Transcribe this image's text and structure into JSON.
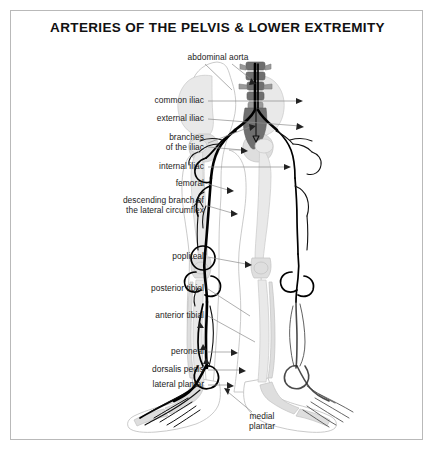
{
  "page": {
    "title": "ARTERIES OF THE PELVIS & LOWER EXTREMITY",
    "background_color": "#ffffff",
    "border_color": "#b9b9b9"
  },
  "figure": {
    "colors": {
      "artery": "#000000",
      "bone": "#e9e9e9",
      "bone_dark": "#6f6f6f",
      "body_outline": "#bdbdbd",
      "leader_line": "#8c8c8c"
    }
  },
  "labels": [
    {
      "id": "abdominal-aorta",
      "text": "abdominal aorta",
      "x": 218,
      "y": 58,
      "align": "center"
    },
    {
      "id": "common-iliac",
      "text": "common iliac",
      "x": 204,
      "y": 101,
      "align": "right"
    },
    {
      "id": "external-iliac",
      "text": "external iliac",
      "x": 204,
      "y": 119,
      "align": "right"
    },
    {
      "id": "branches-of-the-iliac",
      "text": "branches\nof the iliac",
      "x": 204,
      "y": 143,
      "align": "right"
    },
    {
      "id": "internal-iliac",
      "text": "internal iliac",
      "x": 204,
      "y": 167,
      "align": "right"
    },
    {
      "id": "femoral",
      "text": "femoral",
      "x": 204,
      "y": 184,
      "align": "right"
    },
    {
      "id": "descending-branch-of-the-lateral-circumflex",
      "text": "descending branch of\nthe lateral circumflex",
      "x": 204,
      "y": 206,
      "align": "right"
    },
    {
      "id": "popliteal",
      "text": "popliteal",
      "x": 204,
      "y": 257,
      "align": "right"
    },
    {
      "id": "posterior-tibial",
      "text": "posterior tibial",
      "x": 204,
      "y": 289,
      "align": "right"
    },
    {
      "id": "anterior-tibial",
      "text": "anterior tibial",
      "x": 204,
      "y": 316,
      "align": "right"
    },
    {
      "id": "peroneal",
      "text": "peroneal",
      "x": 204,
      "y": 352,
      "align": "right"
    },
    {
      "id": "dorsalis-pedis",
      "text": "dorsalis pedis",
      "x": 204,
      "y": 370,
      "align": "right"
    },
    {
      "id": "lateral-plantar",
      "text": "lateral plantar",
      "x": 204,
      "y": 385,
      "align": "right"
    },
    {
      "id": "medial-plantar",
      "text": "medial\nplantar",
      "x": 262,
      "y": 422,
      "align": "center"
    }
  ]
}
